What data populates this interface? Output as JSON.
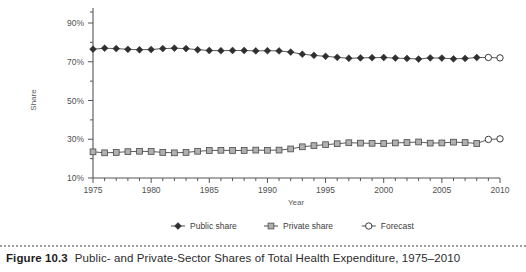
{
  "caption": {
    "number": "Figure 10.3",
    "title": "Public- and Private-Sector Shares of Total Health Expenditure, 1975–2010"
  },
  "chart_data": {
    "type": "line",
    "title": "",
    "xlabel": "Year",
    "ylabel": "Share",
    "xlim": [
      1975,
      2010
    ],
    "ylim": [
      10,
      90
    ],
    "ytick_labels": [
      "10%",
      "30%",
      "50%",
      "70%",
      "90%"
    ],
    "ytick_values": [
      10,
      30,
      50,
      70,
      90
    ],
    "xtick_labels": [
      "1975",
      "1980",
      "1985",
      "1990",
      "1995",
      "2000",
      "2005",
      "2010"
    ],
    "xtick_values": [
      1975,
      1980,
      1985,
      1990,
      1995,
      2000,
      2005,
      2010
    ],
    "minor_xticks": true,
    "minor_yticks": true,
    "grid": false,
    "legend_position": "bottom",
    "x": [
      1975,
      1976,
      1977,
      1978,
      1979,
      1980,
      1981,
      1982,
      1983,
      1984,
      1985,
      1986,
      1987,
      1988,
      1989,
      1990,
      1991,
      1992,
      1993,
      1994,
      1995,
      1996,
      1997,
      1998,
      1999,
      2000,
      2001,
      2002,
      2003,
      2004,
      2005,
      2006,
      2007,
      2008,
      2009,
      2010
    ],
    "series": [
      {
        "name": "Public share",
        "marker": "filled-diamond",
        "color": "#333333",
        "values": [
          76.5,
          77.0,
          76.8,
          76.4,
          76.2,
          76.3,
          76.8,
          77.0,
          76.8,
          76.2,
          75.8,
          75.7,
          75.8,
          75.8,
          75.6,
          75.7,
          75.6,
          75.0,
          73.9,
          73.3,
          72.8,
          72.3,
          71.8,
          72.0,
          72.1,
          72.2,
          71.9,
          71.7,
          71.4,
          72.0,
          71.9,
          71.5,
          71.7,
          72.2,
          null,
          null
        ]
      },
      {
        "name": "Private share",
        "marker": "filled-square",
        "color": "#a8a8a8",
        "values": [
          23.5,
          23.0,
          23.2,
          23.6,
          23.8,
          23.7,
          23.2,
          23.0,
          23.2,
          23.8,
          24.2,
          24.3,
          24.2,
          24.2,
          24.4,
          24.3,
          24.4,
          25.0,
          26.1,
          26.7,
          27.2,
          27.7,
          28.2,
          28.0,
          27.9,
          27.8,
          28.1,
          28.3,
          28.6,
          28.0,
          28.1,
          28.5,
          28.3,
          27.8,
          null,
          null
        ]
      },
      {
        "name": "Forecast",
        "marker": "open-circle",
        "color": "#ffffff",
        "values": [
          null,
          null,
          null,
          null,
          null,
          null,
          null,
          null,
          null,
          null,
          null,
          null,
          null,
          null,
          null,
          null,
          null,
          null,
          null,
          null,
          null,
          null,
          null,
          null,
          null,
          null,
          null,
          null,
          null,
          null,
          null,
          null,
          null,
          null,
          72.2,
          72.0
        ],
        "values_secondary": [
          null,
          null,
          null,
          null,
          null,
          null,
          null,
          null,
          null,
          null,
          null,
          null,
          null,
          null,
          null,
          null,
          null,
          null,
          null,
          null,
          null,
          null,
          null,
          null,
          null,
          null,
          null,
          null,
          null,
          null,
          null,
          null,
          null,
          null,
          29.9,
          30.2
        ]
      }
    ],
    "legend": [
      {
        "label": "Public share",
        "marker": "filled-diamond"
      },
      {
        "label": "Private share",
        "marker": "filled-square"
      },
      {
        "label": "Forecast",
        "marker": "open-circle"
      }
    ]
  }
}
